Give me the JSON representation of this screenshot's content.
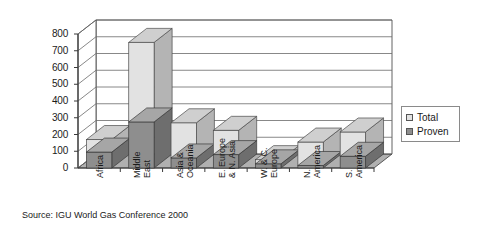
{
  "chart_data": {
    "type": "bar",
    "title": "",
    "subtitle": "",
    "xlabel": "",
    "ylabel": "",
    "ylim": [
      0,
      800
    ],
    "yticks": [
      0,
      100,
      200,
      300,
      400,
      500,
      600,
      700,
      800
    ],
    "grid": true,
    "three_d": true,
    "legend_position": "right",
    "categories": [
      "Africa",
      "Middle East",
      "Asia & Oceania",
      "E. Europe & N. Asia",
      "W. & C. Europe",
      "N. America",
      "S. America"
    ],
    "category_lines": [
      [
        "Africa"
      ],
      [
        "Middle",
        "East"
      ],
      [
        "Asia &",
        "Oceania"
      ],
      [
        "E. Europe",
        "& N. Asia"
      ],
      [
        "W. & C.",
        "Europe"
      ],
      [
        "N.",
        "America"
      ],
      [
        "S.",
        "America"
      ]
    ],
    "series": [
      {
        "name": "Total",
        "color": "#e2e2e2",
        "values": [
          170,
          750,
          270,
          225,
          50,
          155,
          215
        ]
      },
      {
        "name": "Proven",
        "color": "#8e8e8e",
        "values": [
          95,
          275,
          60,
          80,
          25,
          15,
          70
        ]
      }
    ],
    "source": "Source: IGU World Gas Conference 2000"
  },
  "legend": {
    "items": [
      {
        "label": "Total"
      },
      {
        "label": "Proven"
      }
    ]
  },
  "axis": {
    "ytick_labels": [
      "800",
      "700",
      "600",
      "500",
      "400",
      "300",
      "200",
      "100",
      "0"
    ]
  },
  "footer": {
    "source_text": "Source: IGU World Gas Conference 2000"
  },
  "colors": {
    "total_face": "#e2e2e2",
    "total_side": "#b4b4b4",
    "total_top": "#cfcfcf",
    "proven_face": "#8e8e8e",
    "proven_side": "#6e6e6e",
    "proven_top": "#a6a6a6",
    "floor": "#b0b0b0",
    "grid": "#6a6a6a",
    "axis": "#3a3a3a"
  }
}
